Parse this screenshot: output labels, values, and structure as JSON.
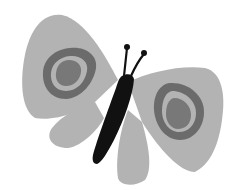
{
  "image": {
    "subject": "butterfly illustration",
    "colors": {
      "background": "#ffffff",
      "wing": "#b3b3b3",
      "eyespot_ring": "#6b6b6b",
      "eyespot_gap": "#b3b3b3",
      "eyespot_center": "#787878",
      "body": "#111111"
    }
  }
}
